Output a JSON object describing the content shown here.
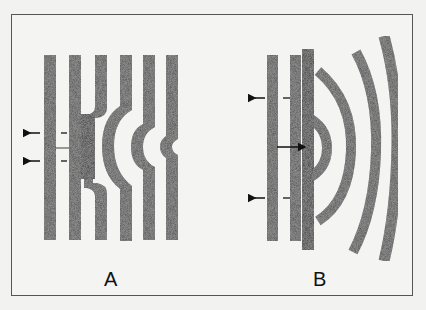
{
  "figure": {
    "panels": [
      {
        "id": "A",
        "label": "A",
        "description": "planar wavefronts with a bulge propagating away from an obstacle"
      },
      {
        "id": "B",
        "label": "B",
        "description": "curved wavefronts radiating from an open end"
      }
    ],
    "colors": {
      "stripe": "#3d3d3d",
      "solid_block": "#050505",
      "arrow": "#111111",
      "frame": "#555555",
      "background": "#f4f4f2"
    }
  }
}
